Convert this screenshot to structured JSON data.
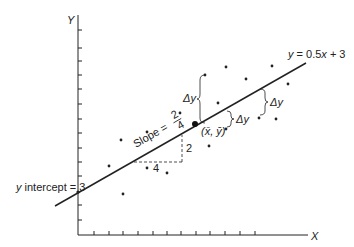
{
  "axes": {
    "x_label": "X",
    "y_label": "Y",
    "x_ticks": 12,
    "y_ticks": 12
  },
  "regression_line": {
    "equation": "y = 0.5x + 3",
    "intercept_label": "y intercept = 3",
    "slope_label": "Slope =",
    "slope_numerator": "2",
    "slope_denominator": "4",
    "rise_label": "2",
    "run_label": "4"
  },
  "mean_point": {
    "label": "(x̄, ȳ)"
  },
  "deviation_labels": [
    "Δy",
    "Δy",
    "Δy"
  ],
  "colors": {
    "ink": "#222222",
    "background": "#ffffff"
  },
  "points": [
    [
      121,
      140
    ],
    [
      147,
      132
    ],
    [
      109,
      166
    ],
    [
      147,
      168
    ],
    [
      167,
      173
    ],
    [
      123,
      194
    ],
    [
      226,
      67
    ],
    [
      272,
      66
    ],
    [
      205,
      75
    ],
    [
      246,
      79
    ],
    [
      288,
      84
    ],
    [
      218,
      103
    ],
    [
      180,
      113
    ],
    [
      259,
      118
    ],
    [
      276,
      119
    ],
    [
      226,
      129
    ],
    [
      209,
      146
    ]
  ]
}
